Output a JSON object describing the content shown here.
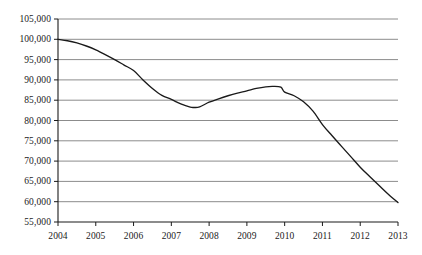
{
  "chart_data": {
    "type": "line",
    "title": "",
    "subtitle": "",
    "xlabel": "",
    "ylabel": "",
    "grid": true,
    "legend": false,
    "legend_position": "none",
    "xlim": [
      2004,
      2013
    ],
    "ylim": [
      55000,
      105000
    ],
    "y_tick_step": 5000,
    "categories": [
      "2004",
      "2005",
      "2006",
      "2007",
      "2008",
      "2009",
      "2010",
      "2011",
      "2012",
      "2013"
    ],
    "x": [
      2004,
      2005,
      2006,
      2007,
      2008,
      2009,
      2010,
      2011,
      2012,
      2013
    ],
    "values": [
      100000,
      97400,
      92300,
      85200,
      84500,
      87300,
      87000,
      79000,
      68500,
      59800
    ],
    "ytick_labels": [
      "105,000",
      "100,000",
      "95,000",
      "90,000",
      "85,000",
      "80,000",
      "75,000",
      "70,000",
      "65,000",
      "60,000",
      "55,000"
    ],
    "ytick_values": [
      105000,
      100000,
      95000,
      90000,
      85000,
      80000,
      75000,
      70000,
      65000,
      60000,
      55000
    ],
    "xtick_labels": [
      "2004",
      "2005",
      "2006",
      "2007",
      "2008",
      "2009",
      "2010",
      "2011",
      "2012",
      "2013"
    ],
    "annotations": [],
    "series": [
      {
        "name": "series-1",
        "color": "#1a1a1a",
        "values": [
          100000,
          97400,
          92300,
          85200,
          84500,
          87300,
          87000,
          79000,
          68500,
          59800
        ],
        "dense_points": [
          [
            2004.0,
            100000
          ],
          [
            2004.25,
            99650
          ],
          [
            2004.5,
            99100
          ],
          [
            2004.75,
            98350
          ],
          [
            2005.0,
            97400
          ],
          [
            2005.25,
            96250
          ],
          [
            2005.5,
            95000
          ],
          [
            2005.75,
            93650
          ],
          [
            2006.0,
            92300
          ],
          [
            2006.25,
            90000
          ],
          [
            2006.5,
            87900
          ],
          [
            2006.75,
            86200
          ],
          [
            2007.0,
            85200
          ],
          [
            2007.25,
            84100
          ],
          [
            2007.5,
            83300
          ],
          [
            2007.6,
            83200
          ],
          [
            2007.75,
            83350
          ],
          [
            2008.0,
            84500
          ],
          [
            2008.25,
            85350
          ],
          [
            2008.5,
            86100
          ],
          [
            2008.75,
            86750
          ],
          [
            2009.0,
            87300
          ],
          [
            2009.25,
            87900
          ],
          [
            2009.5,
            88300
          ],
          [
            2009.7,
            88400
          ],
          [
            2009.9,
            88200
          ],
          [
            2010.0,
            87000
          ],
          [
            2010.25,
            86100
          ],
          [
            2010.5,
            84600
          ],
          [
            2010.75,
            82300
          ],
          [
            2011.0,
            79000
          ],
          [
            2011.25,
            76300
          ],
          [
            2011.5,
            73700
          ],
          [
            2011.75,
            71100
          ],
          [
            2012.0,
            68500
          ],
          [
            2012.25,
            66200
          ],
          [
            2012.5,
            64000
          ],
          [
            2012.75,
            61800
          ],
          [
            2013.0,
            59800
          ]
        ],
        "key_points": {
          "start_2004": 100000,
          "local_min_value": 83200,
          "local_min_year": 2007.6,
          "local_max_value": 88400,
          "local_max_year": 2009.7,
          "end_2013": 59800
        }
      }
    ],
    "colors": {
      "line": "#1a1a1a",
      "gridline": "#8c8c8c",
      "axis": "#1a1a1a",
      "background": "#ffffff",
      "text": "#1a1a1a"
    }
  }
}
